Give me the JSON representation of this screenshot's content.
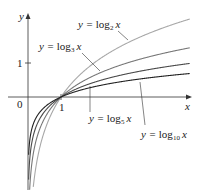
{
  "chart_data": {
    "type": "line",
    "title": "",
    "xlabel": "x",
    "ylabel": "y",
    "origin_label": "0",
    "x_ticks": [
      {
        "value": 1,
        "label": "1"
      }
    ],
    "y_ticks": [
      {
        "value": 1,
        "label": "1"
      }
    ],
    "xlim": [
      0,
      4.6
    ],
    "ylim": [
      -2.8,
      1.4
    ],
    "grid": false,
    "legend": "inline annotations with arrows",
    "series": [
      {
        "name": "y = log2 x",
        "base": 2,
        "color": "#a8a8a8",
        "label_base": "log",
        "label_sub": "2"
      },
      {
        "name": "y = log3 x",
        "base": 3,
        "color": "#777777",
        "label_base": "log",
        "label_sub": "3"
      },
      {
        "name": "y = log5 x",
        "base": 5,
        "color": "#4a4a4a",
        "label_base": "log",
        "label_sub": "5"
      },
      {
        "name": "y = log10 x",
        "base": 10,
        "color": "#222222",
        "label_base": "log",
        "label_sub": "10"
      }
    ]
  },
  "labels": {
    "y_axis": "y",
    "x_axis": "x",
    "origin": "0",
    "x_tick_1": "1",
    "y_tick_1": "1",
    "eq_prefix": "y = ",
    "log": "log",
    "var": "x",
    "sub2": "2",
    "sub3": "3",
    "sub5": "5",
    "sub10": "10"
  }
}
